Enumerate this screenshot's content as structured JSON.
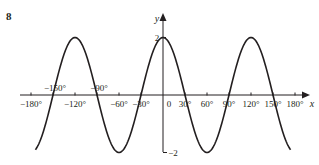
{
  "question_number": "8",
  "chart_data": {
    "type": "line",
    "title": "",
    "xlabel": "x",
    "ylabel": "y",
    "function": "y = 2cos(3x)",
    "xlim": [
      -180,
      180
    ],
    "ylim": [
      -2,
      2
    ],
    "grid": false,
    "x_ticks": [
      -180,
      -120,
      -60,
      -30,
      30,
      60,
      90,
      120,
      150,
      180
    ],
    "x_tick_labels_below": [
      "−180°",
      "−120°",
      "−60°",
      "−30°",
      "30°",
      "60°",
      "90°",
      "120°",
      "150°",
      "180°"
    ],
    "x_tick_labels_above": [
      "−150°",
      "−90°"
    ],
    "origin_label": "0",
    "y_tick_labels": [
      "2",
      "−2"
    ],
    "series": [
      {
        "name": "y = 2cos 3x",
        "x": [
          -180,
          -150,
          -120,
          -90,
          -60,
          -30,
          0,
          30,
          60,
          90,
          120,
          150,
          180
        ],
        "values": [
          -2,
          0,
          2,
          0,
          -2,
          0,
          2,
          0,
          -2,
          0,
          2,
          0,
          -2
        ]
      }
    ],
    "key_points": {
      "maxima": [
        [
          -120,
          2
        ],
        [
          0,
          2
        ],
        [
          120,
          2
        ]
      ],
      "minima": [
        [
          -60,
          -2
        ],
        [
          60,
          -2
        ]
      ],
      "zeros": [
        -150,
        -90,
        -30,
        30,
        90,
        150
      ]
    }
  }
}
